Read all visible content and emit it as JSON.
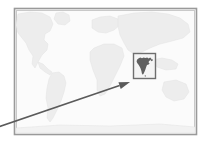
{
  "figure": {
    "kind": "world-map-with-inset-callout",
    "canvas": {
      "width": 207,
      "height": 147,
      "background": "#ffffff"
    },
    "map_frame": {
      "label": "world-map",
      "x": 14,
      "y": 8,
      "width": 183,
      "height": 127,
      "border_color": "#9a9a9a",
      "inner_border_color": "#c9c9c9",
      "ocean_color": "#fbfbfb",
      "land_color": "#ededed",
      "land_outline_color": "#e2e2e2"
    },
    "continents": [
      {
        "name": "north-america"
      },
      {
        "name": "south-america"
      },
      {
        "name": "europe"
      },
      {
        "name": "africa"
      },
      {
        "name": "asia"
      },
      {
        "name": "australia"
      },
      {
        "name": "greenland"
      }
    ],
    "inset_box": {
      "label": "india-highlight-box",
      "x": 133,
      "y": 53,
      "width": 23,
      "height": 26,
      "stroke_color": "#6e6e6e",
      "stroke_width": 1.4,
      "fill_color": "#f4f4f4"
    },
    "highlighted_country": {
      "name": "india",
      "fill_color": "#5f5f5f"
    },
    "callout_arrow": {
      "label": "callout-arrow",
      "from_x": -2,
      "from_y": 127,
      "to_x": 130,
      "to_y": 82,
      "color": "#5a5a5a",
      "line_width": 1.6,
      "arrowhead": "solid-triangle"
    }
  }
}
